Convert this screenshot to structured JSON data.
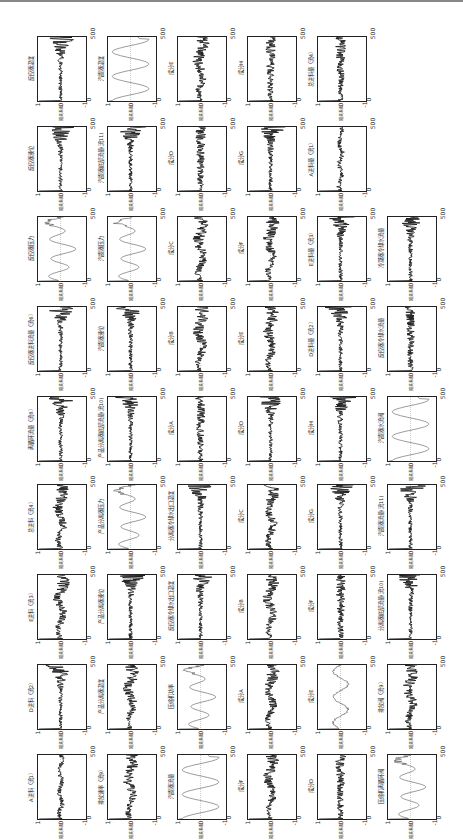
{
  "figure": {
    "orientation": "rotated-90-ccw",
    "axis": {
      "y_ticks": [
        "1",
        "0",
        "-1"
      ],
      "x_ticks": [
        "0",
        "500"
      ],
      "ylabel": "相关系数"
    },
    "bands": [
      {
        "top": 28,
        "panels": [
          {
            "label": "反应器温度",
            "kind": "noise-burst"
          },
          {
            "label": "汽提器温度",
            "kind": "sine"
          },
          {
            "label": "成分E",
            "kind": "noise-drift"
          },
          {
            "label": "成分H",
            "kind": "noise"
          },
          {
            "label": "总进料量（流4）",
            "kind": "noise"
          }
        ]
      },
      {
        "top": 118,
        "panels": [
          {
            "label": "反应器液位",
            "kind": "noise-burst"
          },
          {
            "label": "汽提器底部流量(流11)",
            "kind": "noise-burst"
          },
          {
            "label": "成分D",
            "kind": "noise"
          },
          {
            "label": "成分G",
            "kind": "noise-burst"
          },
          {
            "label": "A进料量（流1）",
            "kind": "smooth-noise"
          }
        ]
      },
      {
        "top": 208,
        "panels": [
          {
            "label": "反应器压力",
            "kind": "wave"
          },
          {
            "label": "汽提器压力",
            "kind": "wave"
          },
          {
            "label": "成分C",
            "kind": "noise-drift"
          },
          {
            "label": "成分F",
            "kind": "noise-drift"
          },
          {
            "label": "E进料量（流3）",
            "kind": "noise-burst"
          },
          {
            "label": "冷凝器冷却水流量",
            "kind": "noise-burst"
          }
        ]
      },
      {
        "top": 298,
        "panels": [
          {
            "label": "反应器进料流量（流6）",
            "kind": "noise-burst"
          },
          {
            "label": "汽提器液位",
            "kind": "noise-burst"
          },
          {
            "label": "成分B",
            "kind": "noise-drift"
          },
          {
            "label": "成分E",
            "kind": "noise-drift"
          },
          {
            "label": "D进料量（流2）",
            "kind": "noise-burst"
          },
          {
            "label": "反应器冷却水流量",
            "kind": "noise"
          }
        ]
      },
      {
        "top": 388,
        "panels": [
          {
            "label": "再循环流量（流8）",
            "kind": "noise-burst"
          },
          {
            "label": "产品分离器底部流量(流10)",
            "kind": "noise-burst"
          },
          {
            "label": "成分A",
            "kind": "noise"
          },
          {
            "label": "成分D",
            "kind": "noise-burst"
          },
          {
            "label": "成分H",
            "kind": "noise-burst"
          },
          {
            "label": "汽提器水流阀",
            "kind": "sine"
          }
        ]
      },
      {
        "top": 476,
        "panels": [
          {
            "label": "总进料（流4）",
            "kind": "noise-drift"
          },
          {
            "label": "产品分离器压力",
            "kind": "wave"
          },
          {
            "label": "分离器冷却水出口温度",
            "kind": "noise-burst"
          },
          {
            "label": "成分C",
            "kind": "noise-drift"
          },
          {
            "label": "成分G",
            "kind": "noise-burst"
          },
          {
            "label": "汽提器流量(流11)",
            "kind": "noise-burst"
          }
        ]
      },
      {
        "top": 566,
        "panels": [
          {
            "label": "E进料（流3）",
            "kind": "noise-drift"
          },
          {
            "label": "产品分离器液位",
            "kind": "noise-burst"
          },
          {
            "label": "反应器冷却水出口温度",
            "kind": "noise-burst"
          },
          {
            "label": "成分B",
            "kind": "noise-drift"
          },
          {
            "label": "成分F",
            "kind": "noise"
          },
          {
            "label": "分离器底部流量(流10)",
            "kind": "noise-burst"
          }
        ]
      },
      {
        "top": 656,
        "panels": [
          {
            "label": "D进料（流2）",
            "kind": "noise-burst"
          },
          {
            "label": "产品分离器温度",
            "kind": "noise-drift"
          },
          {
            "label": "压缩机功率",
            "kind": "wave"
          },
          {
            "label": "成分A",
            "kind": "noise-drift"
          },
          {
            "label": "成分E",
            "kind": "smooth-wave"
          },
          {
            "label": "排放阀（流9）",
            "kind": "noise-drift"
          }
        ]
      },
      {
        "top": 746,
        "panels": [
          {
            "label": "A进料（流1）",
            "kind": "smooth-noise"
          },
          {
            "label": "排放速率（流9）",
            "kind": "noise-drift"
          },
          {
            "label": "汽提器流量",
            "kind": "sine"
          },
          {
            "label": "成分F",
            "kind": "noise-drift"
          },
          {
            "label": "成分D",
            "kind": "noise"
          },
          {
            "label": "压缩机再循环阀",
            "kind": "wave"
          }
        ]
      }
    ],
    "column_x": [
      27,
      97,
      167,
      237,
      307,
      377
    ]
  }
}
